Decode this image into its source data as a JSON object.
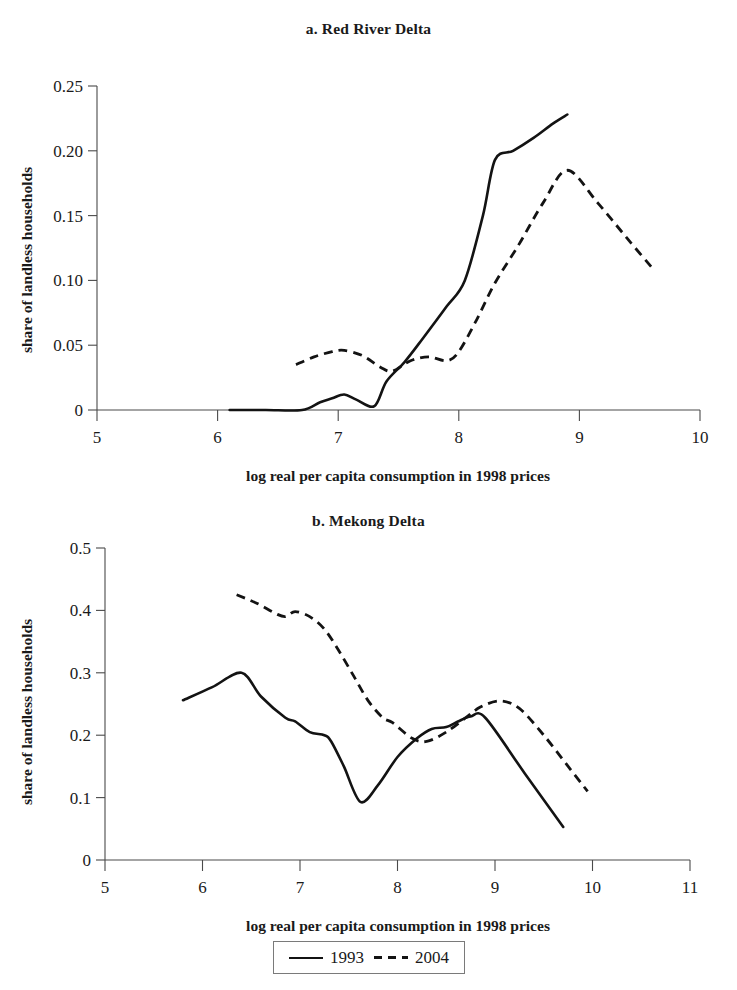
{
  "figure": {
    "xlabel": "log real per capita consumption in 1998 prices",
    "ylabel": "share of landless households"
  },
  "legend": {
    "entries": [
      {
        "label": "1993",
        "style": "solid"
      },
      {
        "label": "2004",
        "style": "dashed"
      }
    ]
  },
  "chart_data": [
    {
      "type": "line",
      "title": "a. Red River Delta",
      "xlabel": "log real per capita consumption in 1998 prices",
      "ylabel": "share of landless households",
      "xlim": [
        5,
        10
      ],
      "ylim": [
        0,
        0.25
      ],
      "xticks": [
        5,
        6,
        7,
        8,
        9,
        10
      ],
      "xtick_labels": [
        "5",
        "6",
        "7",
        "8",
        "9",
        "10"
      ],
      "yticks": [
        0,
        0.05,
        0.1,
        0.15,
        0.2,
        0.25
      ],
      "ytick_labels": [
        "0",
        "0.05",
        "0.10",
        "0.15",
        "0.20",
        "0.25"
      ],
      "grid": false,
      "legend_position": "below figure",
      "series": [
        {
          "name": "1993",
          "style": "solid",
          "x": [
            6.1,
            6.4,
            6.7,
            6.85,
            6.95,
            7.05,
            7.15,
            7.3,
            7.4,
            7.55,
            7.7,
            7.9,
            8.05,
            8.2,
            8.3,
            8.45,
            8.62,
            8.78,
            8.9
          ],
          "y": [
            0.0,
            0.0,
            0.0,
            0.006,
            0.009,
            0.012,
            0.008,
            0.003,
            0.022,
            0.037,
            0.055,
            0.08,
            0.1,
            0.15,
            0.193,
            0.2,
            0.21,
            0.221,
            0.228
          ]
        },
        {
          "name": "2004",
          "style": "dashed",
          "x": [
            6.65,
            6.8,
            6.95,
            7.05,
            7.2,
            7.35,
            7.45,
            7.6,
            7.75,
            7.9,
            8.0,
            8.15,
            8.3,
            8.5,
            8.7,
            8.9,
            9.15,
            9.4,
            9.6
          ],
          "y": [
            0.035,
            0.041,
            0.045,
            0.046,
            0.042,
            0.033,
            0.03,
            0.038,
            0.041,
            0.038,
            0.045,
            0.07,
            0.098,
            0.128,
            0.16,
            0.185,
            0.16,
            0.132,
            0.11
          ]
        }
      ]
    },
    {
      "type": "line",
      "title": "b. Mekong Delta",
      "xlabel": "log real per capita consumption in 1998 prices",
      "ylabel": "share of landless households",
      "xlim": [
        5,
        11
      ],
      "ylim": [
        0,
        0.5
      ],
      "xticks": [
        5,
        6,
        7,
        8,
        9,
        10,
        11
      ],
      "xtick_labels": [
        "5",
        "6",
        "7",
        "8",
        "9",
        "10",
        "11"
      ],
      "yticks": [
        0,
        0.1,
        0.2,
        0.3,
        0.4,
        0.5
      ],
      "ytick_labels": [
        "0",
        "0.1",
        "0.2",
        "0.3",
        "0.4",
        "0.5"
      ],
      "grid": false,
      "legend_position": "below figure",
      "series": [
        {
          "name": "1993",
          "style": "solid",
          "x": [
            5.8,
            6.1,
            6.4,
            6.6,
            6.85,
            6.95,
            7.1,
            7.25,
            7.32,
            7.45,
            7.62,
            7.8,
            8.0,
            8.2,
            8.35,
            8.5,
            8.62,
            8.75,
            8.9,
            9.3,
            9.7
          ],
          "y": [
            0.256,
            0.277,
            0.3,
            0.262,
            0.228,
            0.222,
            0.205,
            0.2,
            0.19,
            0.15,
            0.093,
            0.12,
            0.165,
            0.195,
            0.21,
            0.213,
            0.222,
            0.23,
            0.228,
            0.14,
            0.053
          ]
        },
        {
          "name": "2004",
          "style": "dashed",
          "x": [
            6.35,
            6.55,
            6.75,
            6.85,
            6.95,
            7.1,
            7.25,
            7.4,
            7.55,
            7.7,
            7.85,
            7.95,
            8.15,
            8.3,
            8.5,
            8.7,
            8.85,
            9.05,
            9.25,
            9.5,
            9.75,
            9.95
          ],
          "y": [
            0.425,
            0.412,
            0.395,
            0.39,
            0.398,
            0.39,
            0.37,
            0.335,
            0.295,
            0.255,
            0.228,
            0.22,
            0.195,
            0.19,
            0.205,
            0.228,
            0.245,
            0.255,
            0.243,
            0.2,
            0.15,
            0.11
          ]
        }
      ]
    }
  ]
}
